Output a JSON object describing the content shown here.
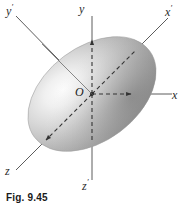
{
  "figure": {
    "caption": "Fig. 9.45",
    "origin_label": "O",
    "background_color": "#ffffff",
    "line_color": "#3a3a3a",
    "text_color": "#2b2b2b"
  },
  "axes": [
    {
      "id": "y-prime",
      "base": "y",
      "prime": "′",
      "label": "y′",
      "orientation": "upper-left-diagonal",
      "style": "solid",
      "arrowhead": false,
      "label_x": 6,
      "label_y": 4
    },
    {
      "id": "y",
      "base": "y",
      "prime": "",
      "label": "y",
      "orientation": "vertical-up",
      "style": "solid",
      "arrowhead": false,
      "label_x": 79,
      "label_y": 3
    },
    {
      "id": "x-prime",
      "base": "x",
      "prime": "′",
      "label": "x′",
      "orientation": "upper-right-diagonal",
      "style": "solid",
      "arrowhead": false,
      "label_x": 166,
      "label_y": 6
    },
    {
      "id": "x",
      "base": "x",
      "prime": "",
      "label": "x",
      "orientation": "horizontal-right",
      "style": "solid",
      "arrowhead": false,
      "label_x": 171,
      "label_y": 92
    },
    {
      "id": "z",
      "base": "z",
      "prime": "",
      "label": "z",
      "orientation": "lower-left-diagonal",
      "style": "solid",
      "arrowhead": false,
      "label_x": 7,
      "label_y": 166
    },
    {
      "id": "z-prime",
      "base": "z",
      "prime": "′",
      "label": "z′",
      "orientation": "vertical-down",
      "style": "solid",
      "arrowhead": false,
      "label_x": 82,
      "label_y": 182
    }
  ],
  "ellipsoid": {
    "center_x": 92,
    "center_y": 94,
    "semi_major": 72,
    "semi_minor": 47,
    "rotation_deg": -37,
    "highlight_color": "#fbfbfb",
    "mid_color": "#b6b6b6",
    "edge_color": "#8a8a8a"
  },
  "interior_vectors": [
    {
      "id": "y-axis-vector",
      "label": "",
      "direction": "up",
      "style": "dashed"
    },
    {
      "id": "x-axis-vector",
      "label": "",
      "direction": "right",
      "style": "dashed"
    },
    {
      "id": "z-axis-vector",
      "label": "",
      "direction": "down-left",
      "style": "dashed"
    },
    {
      "id": "x-prime-vector",
      "label": "",
      "direction": "up-right",
      "style": "dashed"
    }
  ]
}
